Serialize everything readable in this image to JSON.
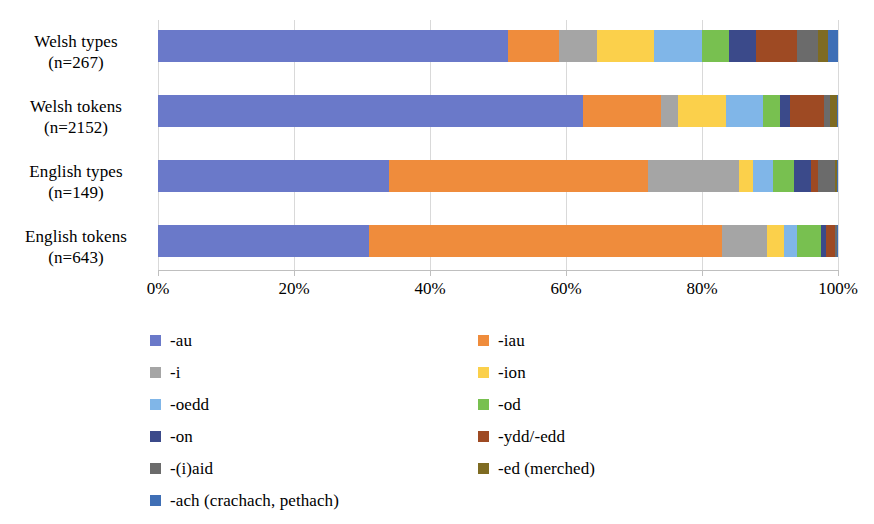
{
  "chart_data": {
    "type": "bar",
    "orientation": "horizontal",
    "stacked": true,
    "normalized_percent": true,
    "title": "",
    "xlabel": "",
    "ylabel": "",
    "xlim": [
      0,
      100
    ],
    "grid": true,
    "legend_position": "bottom",
    "categories": [
      "Welsh types (n=267)",
      "Welsh tokens (n=2152)",
      "English types (n=149)",
      "English tokens (n=643)"
    ],
    "category_lines": [
      [
        "Welsh types",
        "(n=267)"
      ],
      [
        "Welsh tokens",
        "(n=2152)"
      ],
      [
        "English types",
        "(n=149)"
      ],
      [
        "English tokens",
        "(n=643)"
      ]
    ],
    "xticks": [
      "0%",
      "20%",
      "40%",
      "60%",
      "80%",
      "100%"
    ],
    "xtick_values": [
      0,
      20,
      40,
      60,
      80,
      100
    ],
    "series": [
      {
        "name": "-au",
        "color": "#6a79c9",
        "values": [
          51.5,
          62.5,
          34.0,
          31.0
        ]
      },
      {
        "name": "-iau",
        "color": "#ef8c3c",
        "values": [
          7.5,
          11.5,
          38.0,
          52.0
        ]
      },
      {
        "name": "-i",
        "color": "#a5a5a5",
        "values": [
          5.5,
          2.5,
          13.5,
          6.5
        ]
      },
      {
        "name": "-ion",
        "color": "#fbd04b",
        "values": [
          8.5,
          7.0,
          2.0,
          2.5
        ]
      },
      {
        "name": "-oedd",
        "color": "#80b6e8",
        "values": [
          7.0,
          5.5,
          3.0,
          2.0
        ]
      },
      {
        "name": "-od",
        "color": "#78c050",
        "values": [
          4.0,
          2.5,
          3.0,
          3.5
        ]
      },
      {
        "name": "-on",
        "color": "#3b4a8a",
        "values": [
          4.0,
          1.5,
          2.5,
          0.8
        ]
      },
      {
        "name": "-ydd/-edd",
        "color": "#9e4a23",
        "values": [
          6.0,
          5.0,
          1.0,
          1.2
        ]
      },
      {
        "name": "-(i)aid",
        "color": "#6b6b6b",
        "values": [
          3.0,
          0.8,
          2.5,
          0.3
        ]
      },
      {
        "name": "-ed (merched)",
        "color": "#7e6b22",
        "values": [
          1.5,
          1.0,
          0.3,
          0.1
        ]
      },
      {
        "name": "-ach (crachach, pethach)",
        "color": "#3f6fb5",
        "values": [
          1.5,
          0.2,
          0.2,
          0.1
        ]
      }
    ]
  },
  "legend": {
    "items": [
      {
        "label": "-au",
        "color": "#6a79c9"
      },
      {
        "label": "-iau",
        "color": "#ef8c3c"
      },
      {
        "label": "-i",
        "color": "#a5a5a5"
      },
      {
        "label": "-ion",
        "color": "#fbd04b"
      },
      {
        "label": "-oedd",
        "color": "#80b6e8"
      },
      {
        "label": "-od",
        "color": "#78c050"
      },
      {
        "label": "-on",
        "color": "#3b4a8a"
      },
      {
        "label": "-ydd/-edd",
        "color": "#9e4a23"
      },
      {
        "label": "-(i)aid",
        "color": "#6b6b6b"
      },
      {
        "label": "-ed (merched)",
        "color": "#7e6b22"
      },
      {
        "label": "-ach (crachach, pethach)",
        "color": "#3f6fb5"
      }
    ],
    "layout": {
      "col_x": [
        150,
        478
      ],
      "row_y": [
        0,
        32,
        64,
        96,
        128,
        160
      ],
      "order": [
        {
          "item": 0,
          "col": 0,
          "row": 0
        },
        {
          "item": 1,
          "col": 1,
          "row": 0
        },
        {
          "item": 2,
          "col": 0,
          "row": 1
        },
        {
          "item": 3,
          "col": 1,
          "row": 1
        },
        {
          "item": 4,
          "col": 0,
          "row": 2
        },
        {
          "item": 5,
          "col": 1,
          "row": 2
        },
        {
          "item": 6,
          "col": 0,
          "row": 3
        },
        {
          "item": 7,
          "col": 1,
          "row": 3
        },
        {
          "item": 8,
          "col": 0,
          "row": 4
        },
        {
          "item": 9,
          "col": 1,
          "row": 4
        },
        {
          "item": 10,
          "col": 0,
          "row": 5
        }
      ]
    }
  },
  "axis": {
    "plot_left": 158,
    "plot_top": 20,
    "plot_width": 680,
    "plot_height": 250,
    "bar_height": 32,
    "row_tops": [
      10,
      75,
      140,
      205
    ],
    "gridline_color": "#d9d9d9",
    "axis_color": "#bfbfbf"
  }
}
